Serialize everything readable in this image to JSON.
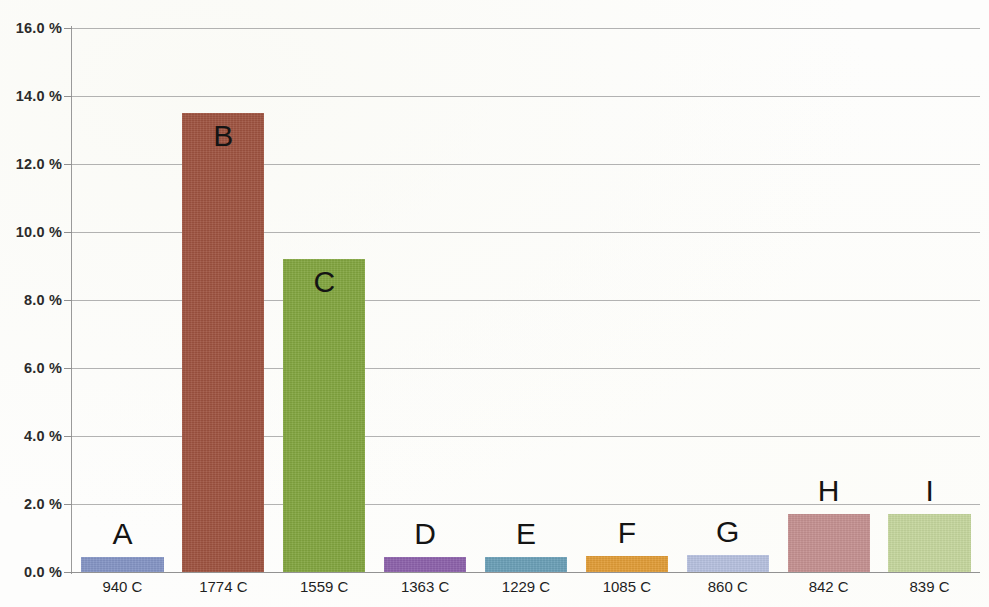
{
  "chart_data": {
    "type": "bar",
    "title": "",
    "xlabel": "",
    "ylabel": "",
    "ylim": [
      0.0,
      16.0
    ],
    "y_tick_labels": [
      "16.0 %",
      "14.0 %",
      "12.0 %",
      "10.0 %",
      "8.0 %",
      "6.0 %",
      "4.0 %",
      "2.0 %",
      "0.0 %"
    ],
    "y_tick_values": [
      16.0,
      14.0,
      12.0,
      10.0,
      8.0,
      6.0,
      4.0,
      2.0,
      0.0
    ],
    "y_axis_unit": "%",
    "grid": true,
    "legend": "none",
    "categories": [
      "940 C",
      "1774 C",
      "1559 C",
      "1363 C",
      "1229 C",
      "1085 C",
      "860 C",
      "842 C",
      "839 C"
    ],
    "point_labels": [
      "A",
      "B",
      "C",
      "D",
      "E",
      "F",
      "G",
      "H",
      "I"
    ],
    "values": [
      0.45,
      13.5,
      9.2,
      0.45,
      0.45,
      0.48,
      0.5,
      1.7,
      1.7
    ],
    "bar_colors": [
      "#8494c4",
      "#9e5340",
      "#82a53f",
      "#8c61aa",
      "#6a9fb6",
      "#e09c37",
      "#b6c0de",
      "#c49090",
      "#c5d69d"
    ],
    "bars": [
      {
        "label": "A",
        "category": "940 C",
        "value": 0.45,
        "color": "#8494c4"
      },
      {
        "label": "B",
        "category": "1774 C",
        "value": 13.5,
        "color": "#9e5340"
      },
      {
        "label": "C",
        "category": "1559 C",
        "value": 9.2,
        "color": "#82a53f"
      },
      {
        "label": "D",
        "category": "1363 C",
        "value": 0.45,
        "color": "#8c61aa"
      },
      {
        "label": "E",
        "category": "1229 C",
        "value": 0.45,
        "color": "#6a9fb6"
      },
      {
        "label": "F",
        "category": "1085 C",
        "value": 0.48,
        "color": "#e09c37"
      },
      {
        "label": "G",
        "category": "860 C",
        "value": 0.5,
        "color": "#b6c0de"
      },
      {
        "label": "H",
        "category": "842 C",
        "value": 1.7,
        "color": "#c49090"
      },
      {
        "label": "I",
        "category": "839 C",
        "value": 1.7,
        "color": "#c5d69d"
      }
    ]
  }
}
